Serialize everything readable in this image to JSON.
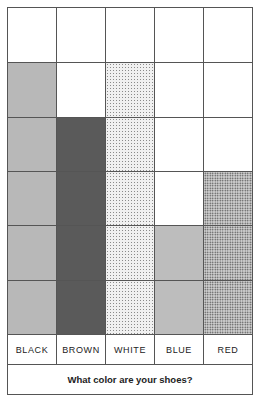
{
  "chart_data": {
    "type": "bar",
    "title": "What color are your shoes?",
    "categories": [
      "BLACK",
      "BROWN",
      "WHITE",
      "BLUE",
      "RED"
    ],
    "values": [
      5,
      4,
      5,
      2,
      3
    ],
    "ylim": [
      0,
      6
    ],
    "grid": true,
    "xlabel": "What color are your shoes?",
    "ylabel": "",
    "style": "pictograph grid, one shaded square per response"
  },
  "labels": [
    "BLACK",
    "BROWN",
    "WHITE",
    "BLUE",
    "RED"
  ],
  "footer": "What color are your shoes?"
}
